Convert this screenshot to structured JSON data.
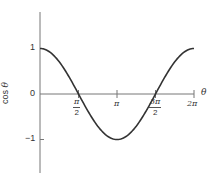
{
  "chart_data": {
    "type": "line",
    "title": "",
    "xlabel": "θ",
    "ylabel": "cos θ",
    "ylabel_parts": {
      "func": "cos",
      "var": "θ"
    },
    "xlim": [
      0,
      6.2832
    ],
    "ylim": [
      -1.7,
      1.8
    ],
    "grid": false,
    "legend": null,
    "x_ticks": [
      {
        "value": 1.5708,
        "label_num": "π",
        "label_den": "2",
        "type": "fraction"
      },
      {
        "value": 3.1416,
        "label": "π",
        "type": "plain"
      },
      {
        "value": 4.7124,
        "label_num": "3π",
        "label_den": "2",
        "type": "fraction"
      },
      {
        "value": 6.2832,
        "label": "2π",
        "type": "plain"
      }
    ],
    "y_ticks": [
      {
        "value": 1,
        "label": "1"
      },
      {
        "value": 0,
        "label": "0"
      },
      {
        "value": -1,
        "label": "−1"
      }
    ],
    "series": [
      {
        "name": "cos θ",
        "x": [
          0,
          0.7854,
          1.5708,
          2.3562,
          3.1416,
          3.927,
          4.7124,
          5.4978,
          6.2832
        ],
        "values": [
          1,
          0.707,
          0,
          -0.707,
          -1,
          -0.707,
          0,
          0.707,
          1
        ]
      }
    ],
    "colors": {
      "curve": "#333333",
      "axis": "#777777"
    }
  }
}
